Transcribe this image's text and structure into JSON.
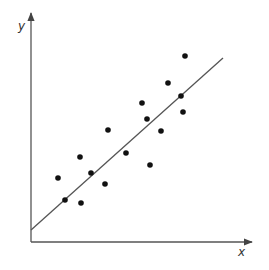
{
  "chart_data": {
    "type": "scatter",
    "title": "",
    "xlabel": "x",
    "ylabel": "y",
    "grid": false,
    "legend": null,
    "axes": {
      "origin_px": [
        31,
        242
      ],
      "x_end_px": 252,
      "y_end_px": 13,
      "has_tick_labels": false
    },
    "x": [
      58,
      65,
      80,
      81,
      91,
      105,
      108,
      126,
      142,
      147,
      150,
      161,
      168,
      181,
      183,
      185
    ],
    "y": [
      178,
      200,
      157,
      203,
      173,
      184,
      130,
      153,
      103,
      119,
      165,
      131,
      83,
      96,
      112,
      56
    ],
    "points_px": [
      [
        58,
        178
      ],
      [
        65,
        200
      ],
      [
        80,
        157
      ],
      [
        81,
        203
      ],
      [
        91,
        173
      ],
      [
        105,
        184
      ],
      [
        108,
        130
      ],
      [
        126,
        153
      ],
      [
        142,
        103
      ],
      [
        147,
        119
      ],
      [
        150,
        165
      ],
      [
        161,
        131
      ],
      [
        168,
        83
      ],
      [
        181,
        96
      ],
      [
        183,
        112
      ],
      [
        185,
        56
      ]
    ],
    "trend_line": {
      "kind": "linear fit",
      "start_px": [
        31,
        230
      ],
      "end_px": [
        223,
        58
      ]
    }
  },
  "style": {
    "axis_color": "#555555",
    "point_color": "#111111",
    "line_color": "#555555"
  }
}
